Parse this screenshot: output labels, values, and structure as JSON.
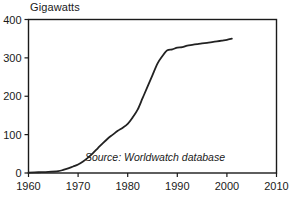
{
  "chart_data": {
    "type": "line",
    "title": "",
    "subtitle": "",
    "xlabel": "",
    "ylabel": "Gigawatts",
    "ylabel_position": "top-left-above-axis",
    "xlim": [
      1960,
      2010
    ],
    "ylim": [
      0,
      400
    ],
    "grid": false,
    "legend": false,
    "x_ticks": [
      1960,
      1970,
      1980,
      1990,
      2000,
      2010
    ],
    "x_tick_labels": [
      "1960",
      "1970",
      "1980",
      "1990",
      "2000",
      "2010"
    ],
    "y_ticks": [
      0,
      100,
      200,
      300,
      400
    ],
    "y_tick_labels": [
      "0",
      "100",
      "200",
      "300",
      "400"
    ],
    "line_color": "#222222",
    "line_width": 1.8,
    "series": [
      {
        "name": "Gigawatts",
        "x": [
          1960,
          1962,
          1964,
          1966,
          1967,
          1968,
          1969,
          1970,
          1971,
          1972,
          1973,
          1974,
          1975,
          1976,
          1977,
          1978,
          1979,
          1980,
          1981,
          1982,
          1983,
          1984,
          1985,
          1986,
          1987,
          1988,
          1989,
          1990,
          1991,
          1992,
          1993,
          1994,
          1995,
          1996,
          1997,
          1998,
          1999,
          2000,
          2001
        ],
        "values": [
          1,
          2,
          3,
          5,
          8,
          12,
          17,
          22,
          30,
          40,
          52,
          65,
          78,
          90,
          100,
          110,
          118,
          128,
          145,
          165,
          195,
          225,
          255,
          285,
          305,
          320,
          322,
          327,
          328,
          332,
          334,
          336,
          338,
          339,
          341,
          343,
          345,
          347,
          350
        ]
      }
    ],
    "annotations": [
      {
        "name": "source-note",
        "text": "Source: Worldwatch database",
        "x": 1985.5,
        "y": 32,
        "style": "italic"
      }
    ]
  },
  "axis": {
    "y_title": "Gigawatts"
  },
  "colors": {
    "background": "#ffffff",
    "frame": "#1a1a1a",
    "line": "#222222",
    "text": "#1a1a1a"
  }
}
